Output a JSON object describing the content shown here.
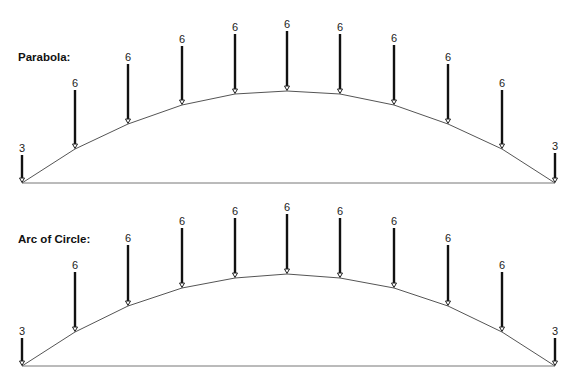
{
  "chart_data": {
    "type": "diagram",
    "diagrams": [
      {
        "title": "Parabola:",
        "title_x": 18,
        "title_y": 61,
        "baseline": {
          "x1": 22,
          "x2": 555,
          "y": 183
        },
        "loads": [
          {
            "label": "3",
            "x": 22,
            "top": 155,
            "node_y": 183
          },
          {
            "label": "6",
            "x": 75,
            "top": 90,
            "node_y": 149
          },
          {
            "label": "6",
            "x": 128,
            "top": 64,
            "node_y": 124
          },
          {
            "label": "6",
            "x": 182,
            "top": 46,
            "node_y": 105
          },
          {
            "label": "6",
            "x": 235,
            "top": 34,
            "node_y": 94
          },
          {
            "label": "6",
            "x": 287,
            "top": 31,
            "node_y": 91
          },
          {
            "label": "6",
            "x": 340,
            "top": 34,
            "node_y": 94
          },
          {
            "label": "6",
            "x": 394,
            "top": 45,
            "node_y": 105
          },
          {
            "label": "6",
            "x": 448,
            "top": 64,
            "node_y": 124
          },
          {
            "label": "6",
            "x": 502,
            "top": 90,
            "node_y": 149
          },
          {
            "label": "3",
            "x": 555,
            "top": 153,
            "node_y": 183
          }
        ]
      },
      {
        "title": "Arc of Circle:",
        "title_x": 18,
        "title_y": 243,
        "baseline": {
          "x1": 22,
          "x2": 555,
          "y": 366
        },
        "loads": [
          {
            "label": "3",
            "x": 22,
            "top": 338,
            "node_y": 366
          },
          {
            "label": "6",
            "x": 75,
            "top": 272,
            "node_y": 332
          },
          {
            "label": "6",
            "x": 128,
            "top": 245,
            "node_y": 306
          },
          {
            "label": "6",
            "x": 182,
            "top": 228,
            "node_y": 288
          },
          {
            "label": "6",
            "x": 235,
            "top": 218,
            "node_y": 278
          },
          {
            "label": "6",
            "x": 287,
            "top": 214,
            "node_y": 274
          },
          {
            "label": "6",
            "x": 340,
            "top": 218,
            "node_y": 278
          },
          {
            "label": "6",
            "x": 394,
            "top": 228,
            "node_y": 288
          },
          {
            "label": "6",
            "x": 448,
            "top": 245,
            "node_y": 306
          },
          {
            "label": "6",
            "x": 502,
            "top": 272,
            "node_y": 332
          },
          {
            "label": "3",
            "x": 555,
            "top": 338,
            "node_y": 366
          }
        ]
      }
    ]
  },
  "colors": {
    "arrow": "#111111",
    "curve": "#555555",
    "baseline": "#777777",
    "background": "#ffffff"
  }
}
